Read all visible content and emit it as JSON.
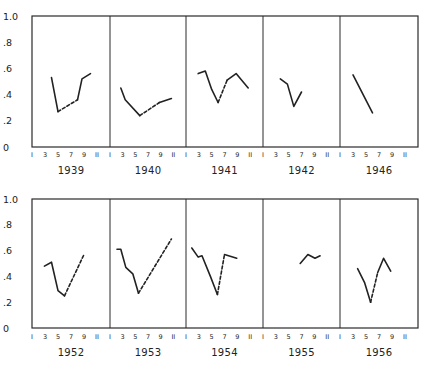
{
  "chart_data": {
    "type": "line",
    "title": "",
    "xlabel": "Month",
    "ylabel": "",
    "ylim": [
      0,
      1.0
    ],
    "xlim": [
      1,
      13
    ],
    "y_ticks": [
      "0",
      ".2",
      ".4",
      ".6",
      ".8",
      "1.0"
    ],
    "x_ticks": [
      "1",
      "3",
      "5",
      "7",
      "9",
      "11"
    ],
    "grid": false,
    "note": "Solid segments = observed; dashed segments = interpolated",
    "rows": [
      {
        "panels": [
          {
            "year": "1939",
            "segments": [
              {
                "style": "solid",
                "points": [
                  [
                    4,
                    0.53
                  ],
                  [
                    5,
                    0.27
                  ]
                ]
              },
              {
                "style": "dashed",
                "points": [
                  [
                    5,
                    0.27
                  ],
                  [
                    8,
                    0.36
                  ]
                ]
              },
              {
                "style": "solid",
                "points": [
                  [
                    8,
                    0.36
                  ],
                  [
                    8.7,
                    0.52
                  ],
                  [
                    10,
                    0.56
                  ]
                ]
              }
            ]
          },
          {
            "year": "1940",
            "segments": [
              {
                "style": "solid",
                "points": [
                  [
                    2.7,
                    0.45
                  ],
                  [
                    3.4,
                    0.36
                  ],
                  [
                    5.7,
                    0.24
                  ]
                ]
              },
              {
                "style": "dashed",
                "points": [
                  [
                    5.7,
                    0.24
                  ],
                  [
                    8.8,
                    0.34
                  ]
                ]
              },
              {
                "style": "solid",
                "points": [
                  [
                    8.8,
                    0.34
                  ],
                  [
                    10.7,
                    0.37
                  ]
                ]
              }
            ]
          },
          {
            "year": "1941",
            "segments": [
              {
                "style": "solid",
                "points": [
                  [
                    2.9,
                    0.56
                  ],
                  [
                    4,
                    0.58
                  ],
                  [
                    5,
                    0.44
                  ],
                  [
                    6,
                    0.34
                  ]
                ]
              },
              {
                "style": "dashed",
                "points": [
                  [
                    6,
                    0.34
                  ],
                  [
                    7.4,
                    0.51
                  ]
                ]
              },
              {
                "style": "solid",
                "points": [
                  [
                    7.4,
                    0.51
                  ],
                  [
                    8.8,
                    0.56
                  ],
                  [
                    10.7,
                    0.45
                  ]
                ]
              }
            ]
          },
          {
            "year": "1942",
            "segments": [
              {
                "style": "solid",
                "points": [
                  [
                    3.7,
                    0.52
                  ],
                  [
                    4.8,
                    0.48
                  ],
                  [
                    5.8,
                    0.31
                  ],
                  [
                    7,
                    0.42
                  ]
                ]
              }
            ]
          },
          {
            "year": "1946",
            "segments": [
              {
                "style": "solid",
                "points": [
                  [
                    3,
                    0.55
                  ],
                  [
                    6,
                    0.26
                  ]
                ]
              }
            ]
          }
        ]
      },
      {
        "panels": [
          {
            "year": "1952",
            "segments": [
              {
                "style": "solid",
                "points": [
                  [
                    2.9,
                    0.48
                  ],
                  [
                    4,
                    0.51
                  ],
                  [
                    5,
                    0.29
                  ],
                  [
                    6,
                    0.25
                  ]
                ]
              },
              {
                "style": "dashed",
                "points": [
                  [
                    6,
                    0.25
                  ],
                  [
                    9,
                    0.57
                  ]
                ]
              }
            ]
          },
          {
            "year": "1953",
            "segments": [
              {
                "style": "solid",
                "points": [
                  [
                    2.1,
                    0.61
                  ],
                  [
                    2.7,
                    0.61
                  ],
                  [
                    3.5,
                    0.47
                  ],
                  [
                    4.6,
                    0.42
                  ],
                  [
                    5.5,
                    0.27
                  ]
                ]
              },
              {
                "style": "dashed",
                "points": [
                  [
                    5.5,
                    0.27
                  ],
                  [
                    10.7,
                    0.69
                  ]
                ]
              }
            ]
          },
          {
            "year": "1954",
            "segments": [
              {
                "style": "solid",
                "points": [
                  [
                    1.9,
                    0.62
                  ],
                  [
                    2.9,
                    0.55
                  ],
                  [
                    3.5,
                    0.56
                  ],
                  [
                    4.8,
                    0.4
                  ],
                  [
                    5.9,
                    0.26
                  ]
                ]
              },
              {
                "style": "dashed",
                "points": [
                  [
                    5.9,
                    0.26
                  ],
                  [
                    7,
                    0.57
                  ]
                ]
              },
              {
                "style": "solid",
                "points": [
                  [
                    7,
                    0.57
                  ],
                  [
                    8.9,
                    0.54
                  ]
                ]
              }
            ]
          },
          {
            "year": "1955",
            "segments": [
              {
                "style": "solid",
                "points": [
                  [
                    6.8,
                    0.5
                  ],
                  [
                    8,
                    0.57
                  ],
                  [
                    9.1,
                    0.54
                  ],
                  [
                    9.9,
                    0.56
                  ]
                ]
              }
            ]
          },
          {
            "year": "1956",
            "segments": [
              {
                "style": "solid",
                "points": [
                  [
                    3.7,
                    0.46
                  ],
                  [
                    4.8,
                    0.35
                  ],
                  [
                    5.7,
                    0.2
                  ]
                ]
              },
              {
                "style": "dashed",
                "points": [
                  [
                    5.7,
                    0.2
                  ],
                  [
                    6.8,
                    0.43
                  ]
                ]
              },
              {
                "style": "solid",
                "points": [
                  [
                    6.8,
                    0.43
                  ],
                  [
                    7.7,
                    0.54
                  ],
                  [
                    8.8,
                    0.44
                  ]
                ]
              }
            ]
          }
        ]
      }
    ]
  },
  "layout": {
    "panel_lefts": [
      32,
      110,
      186,
      263,
      340
    ],
    "panel_right": 418,
    "rows": [
      {
        "top": 16,
        "bottom": 147,
        "tick_y": 157,
        "year_y": 174
      },
      {
        "top": 199,
        "bottom": 328,
        "tick_y": 339,
        "year_y": 356
      }
    ]
  }
}
